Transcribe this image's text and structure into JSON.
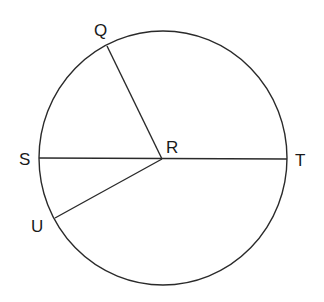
{
  "diagram": {
    "type": "circle-geometry",
    "stroke_color": "#2a2a2a",
    "circle": {
      "cx": 163,
      "cy": 158,
      "rx": 124,
      "ry": 127
    },
    "points": {
      "Q": {
        "label": "Q",
        "x": 107,
        "y": 46,
        "label_x": 94,
        "label_y": 36
      },
      "R": {
        "label": "R",
        "x": 162,
        "y": 159,
        "label_x": 166,
        "label_y": 153
      },
      "S": {
        "label": "S",
        "x": 39,
        "y": 158,
        "label_x": 19,
        "label_y": 165
      },
      "T": {
        "label": "T",
        "x": 287,
        "y": 159,
        "label_x": 295,
        "label_y": 166
      },
      "U": {
        "label": "U",
        "x": 55,
        "y": 218,
        "label_x": 31,
        "label_y": 232
      }
    },
    "segments": [
      {
        "from": "S",
        "to": "T",
        "name": "diameter-ST"
      },
      {
        "from": "R",
        "to": "Q",
        "name": "radius-RQ"
      },
      {
        "from": "R",
        "to": "U",
        "name": "radius-RU"
      }
    ]
  }
}
